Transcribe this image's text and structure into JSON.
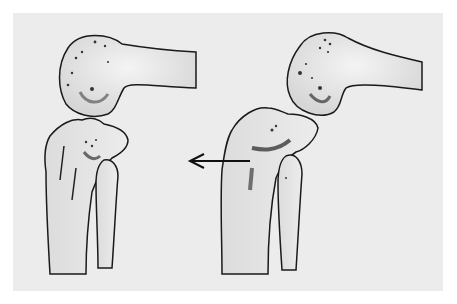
{
  "figure": {
    "type": "medical-illustration",
    "panels": [
      {
        "id": "left",
        "description": "humerus above, proximal ulna and radius below, aligned"
      },
      {
        "id": "right",
        "description": "humerus above, ulna/radius displaced; arrow indicates direction"
      }
    ],
    "arrow": {
      "direction": "left"
    },
    "colors": {
      "background": "#ececec",
      "line": "#1a1a1a",
      "shade": "#555555"
    }
  },
  "caption": {
    "text": ""
  }
}
